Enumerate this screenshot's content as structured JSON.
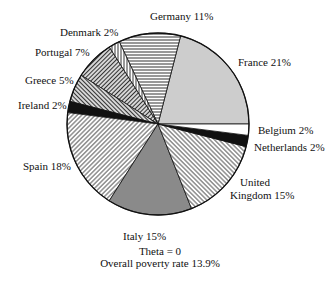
{
  "chart_data": {
    "type": "pie",
    "title": "",
    "annotations": [
      "Theta = 0",
      "Overall poverty rate 13.9%"
    ],
    "start_angle_deg": 0,
    "direction": "counterclockwise",
    "legend": "none (slices labeled directly)",
    "slices": [
      {
        "label": "France",
        "value": 21,
        "text": "France 21%",
        "fill": "#cdcdcd",
        "pattern": "solid"
      },
      {
        "label": "Germany",
        "value": 11,
        "text": "Germany 11%",
        "fill": "#ffffff",
        "pattern": "horizontal"
      },
      {
        "label": "Denmark",
        "value": 2,
        "text": "Denmark 2%",
        "fill": "#ffffff",
        "pattern": "vertical"
      },
      {
        "label": "Portugal",
        "value": 7,
        "text": "Portugal 7%",
        "fill": "#ffffff",
        "pattern": "diag-up-dense"
      },
      {
        "label": "Greece",
        "value": 5,
        "text": "Greece 5%",
        "fill": "#ffffff",
        "pattern": "diag-down-dense"
      },
      {
        "label": "Ireland",
        "value": 2,
        "text": "Ireland 2%",
        "fill": "#111111",
        "pattern": "solid"
      },
      {
        "label": "Spain",
        "value": 18,
        "text": "Spain 18%",
        "fill": "#ffffff",
        "pattern": "diag-up"
      },
      {
        "label": "Italy",
        "value": 15,
        "text": "Italy 15%",
        "fill": "#8a8a8a",
        "pattern": "solid"
      },
      {
        "label": "United Kingdom",
        "value": 15,
        "text": "United Kingdom 15%",
        "fill": "#ffffff",
        "pattern": "diag-down"
      },
      {
        "label": "Netherlands",
        "value": 2,
        "text": "Netherlands 2%",
        "fill": "#111111",
        "pattern": "solid"
      },
      {
        "label": "Belgium",
        "value": 2,
        "text": "Belgium 2%",
        "fill": "#ffffff",
        "pattern": "solid"
      }
    ]
  },
  "labels": {
    "france": "France 21%",
    "germany": "Germany 11%",
    "denmark": "Denmark 2%",
    "portugal": "Portugal 7%",
    "greece": "Greece 5%",
    "ireland": "Ireland 2%",
    "spain": "Spain 18%",
    "italy": "Italy 15%",
    "uk_line1": "United",
    "uk_line2": "Kingdom 15%",
    "netherlands": "Netherlands 2%",
    "belgium": "Belgium 2%"
  },
  "footer": {
    "theta": "Theta = 0",
    "overall": "Overall poverty rate 13.9%"
  }
}
